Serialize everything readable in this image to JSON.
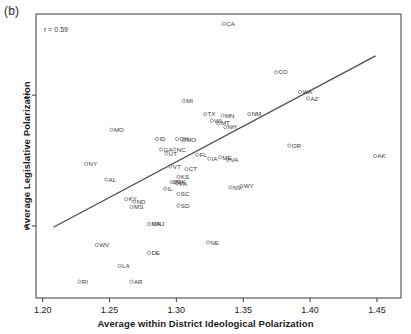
{
  "panel": {
    "label": "(b)"
  },
  "annotation": {
    "r_text": "r = 0.59"
  },
  "chart_data": {
    "type": "scatter",
    "title": "",
    "xlabel": "Average within District Ideological Polarization",
    "ylabel": "Average Legislative Polarization",
    "xlim": [
      1.195,
      1.468
    ],
    "ylim": [
      0.45,
      2.62
    ],
    "xticks": [
      1.2,
      1.25,
      1.3,
      1.35,
      1.4,
      1.45
    ],
    "xticklabels": [
      "1.20",
      "1.25",
      "1.30",
      "1.35",
      "1.40",
      "1.45"
    ],
    "yticks": [
      1,
      2
    ],
    "yticklabels": [
      "1",
      "2"
    ],
    "grid": false,
    "legend": null,
    "correlation": 0.59,
    "fit_line": {
      "x": [
        1.208,
        1.449
      ],
      "y": [
        0.99,
        2.3
      ]
    },
    "point_label": "state",
    "points": [
      {
        "label": "CA",
        "x": 1.3355,
        "y": 2.545
      },
      {
        "label": "CO",
        "x": 1.3745,
        "y": 2.175
      },
      {
        "label": "WA",
        "x": 1.3925,
        "y": 2.025
      },
      {
        "label": "AZ",
        "x": 1.3985,
        "y": 1.975
      },
      {
        "label": "MI",
        "x": 1.3055,
        "y": 1.955
      },
      {
        "label": "TX",
        "x": 1.3215,
        "y": 1.855
      },
      {
        "label": "MN",
        "x": 1.3345,
        "y": 1.845
      },
      {
        "label": "NM",
        "x": 1.3545,
        "y": 1.855
      },
      {
        "label": "WI",
        "x": 1.3265,
        "y": 1.805
      },
      {
        "label": "MT",
        "x": 1.3315,
        "y": 1.785
      },
      {
        "label": "NH",
        "x": 1.3365,
        "y": 1.755
      },
      {
        "label": "MO",
        "x": 1.2515,
        "y": 1.735
      },
      {
        "label": "ID",
        "x": 1.2855,
        "y": 1.665
      },
      {
        "label": "OH",
        "x": 1.3005,
        "y": 1.665
      },
      {
        "label": "MO2",
        "x": 1.3055,
        "y": 1.655
      },
      {
        "label": "OR",
        "x": 1.3845,
        "y": 1.615
      },
      {
        "label": "GA",
        "x": 1.2885,
        "y": 1.585
      },
      {
        "label": "NC",
        "x": 1.2985,
        "y": 1.585
      },
      {
        "label": "UT",
        "x": 1.2925,
        "y": 1.555
      },
      {
        "label": "FL",
        "x": 1.3155,
        "y": 1.545
      },
      {
        "label": "AK",
        "x": 1.4485,
        "y": 1.535
      },
      {
        "label": "IA",
        "x": 1.3245,
        "y": 1.515
      },
      {
        "label": "ME",
        "x": 1.3325,
        "y": 1.525
      },
      {
        "label": "VA",
        "x": 1.3385,
        "y": 1.505
      },
      {
        "label": "NY",
        "x": 1.2325,
        "y": 1.475
      },
      {
        "label": "VT",
        "x": 1.2955,
        "y": 1.455
      },
      {
        "label": "CT",
        "x": 1.3075,
        "y": 1.435
      },
      {
        "label": "AL",
        "x": 1.2475,
        "y": 1.355
      },
      {
        "label": "KS",
        "x": 1.3015,
        "y": 1.375
      },
      {
        "label": "IN",
        "x": 1.2965,
        "y": 1.335
      },
      {
        "label": "WY",
        "x": 1.3485,
        "y": 1.305
      },
      {
        "label": "NV",
        "x": 1.3405,
        "y": 1.295
      },
      {
        "label": "OK",
        "x": 1.2985,
        "y": 1.335
      },
      {
        "label": "PA",
        "x": 1.3005,
        "y": 1.325
      },
      {
        "label": "IL",
        "x": 1.2915,
        "y": 1.285
      },
      {
        "label": "SC",
        "x": 1.3015,
        "y": 1.245
      },
      {
        "label": "KY",
        "x": 1.2625,
        "y": 1.205
      },
      {
        "label": "ND",
        "x": 1.2685,
        "y": 1.185
      },
      {
        "label": "MS",
        "x": 1.2665,
        "y": 1.145
      },
      {
        "label": "SD",
        "x": 1.3015,
        "y": 1.155
      },
      {
        "label": "MA",
        "x": 1.2795,
        "y": 1.015
      },
      {
        "label": "NJ",
        "x": 1.2835,
        "y": 1.015
      },
      {
        "label": "WV",
        "x": 1.2405,
        "y": 0.855
      },
      {
        "label": "NE",
        "x": 1.3235,
        "y": 0.875
      },
      {
        "label": "DE",
        "x": 1.2795,
        "y": 0.795
      },
      {
        "label": "LA",
        "x": 1.2575,
        "y": 0.695
      },
      {
        "label": "RI",
        "x": 1.2275,
        "y": 0.575
      },
      {
        "label": "AR",
        "x": 1.2665,
        "y": 0.575
      }
    ]
  },
  "axes": {
    "x_tick_labels": [
      "1.20",
      "1.25",
      "1.30",
      "1.35",
      "1.40",
      "1.45"
    ],
    "y_tick_labels": [
      "1",
      "2"
    ]
  }
}
